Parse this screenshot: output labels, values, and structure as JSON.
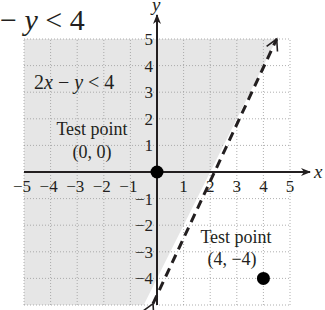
{
  "header_equation": {
    "prefix": "− ",
    "var": "y",
    "suffix": " < 4"
  },
  "chart_data": {
    "type": "line",
    "title": "2x − y < 4",
    "xlabel": "x",
    "ylabel": "y",
    "xlim": [
      -5,
      5
    ],
    "ylim": [
      -5,
      5
    ],
    "grid": true,
    "x_ticks": [
      "−5",
      "−4",
      "−3",
      "−2",
      "−1",
      "1",
      "2",
      "3",
      "4",
      "5"
    ],
    "y_ticks": [
      "5",
      "4",
      "3",
      "2",
      "1",
      "−1",
      "−2",
      "−3",
      "−4"
    ],
    "boundary_line": {
      "equation": "y = 2x − 4",
      "style": "dashed",
      "from": [
        0,
        -4
      ],
      "to": [
        4.5,
        5
      ],
      "arrows": "both"
    },
    "shaded_region": {
      "description": "left/above the boundary line",
      "color": "#e6e6e6"
    },
    "inequality_label": {
      "parts": [
        "2",
        "x",
        " − ",
        "y",
        " < 4"
      ]
    },
    "test_points": [
      {
        "label": "Test point",
        "coords_text": "(0, 0)",
        "x": 0,
        "y": 0
      },
      {
        "label": "Test point",
        "coords_text": "(4, −4)",
        "x": 4,
        "y": -4
      }
    ]
  }
}
